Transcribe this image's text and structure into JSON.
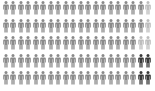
{
  "chart_data": {
    "type": "pictogram",
    "title": "",
    "total_units": 100,
    "columns": 20,
    "rows": 5,
    "icon": "person-icon",
    "categories": [
      "gray",
      "light",
      "dark"
    ],
    "values": [
      92,
      4,
      4
    ],
    "colors": {
      "gray": "#8a8a8a",
      "light": "#bdbdbd",
      "dark": "#3a3a3a"
    },
    "grid": [
      [
        "gray",
        "gray",
        "gray",
        "gray",
        "gray",
        "gray",
        "gray",
        "gray",
        "gray",
        "gray",
        "gray",
        "gray",
        "gray",
        "gray",
        "gray",
        "gray",
        "gray",
        "gray",
        "gray",
        "light"
      ],
      [
        "gray",
        "gray",
        "gray",
        "gray",
        "gray",
        "gray",
        "gray",
        "gray",
        "gray",
        "gray",
        "gray",
        "gray",
        "gray",
        "gray",
        "gray",
        "gray",
        "gray",
        "gray",
        "gray",
        "light"
      ],
      [
        "gray",
        "gray",
        "gray",
        "gray",
        "gray",
        "gray",
        "gray",
        "gray",
        "gray",
        "gray",
        "gray",
        "gray",
        "gray",
        "gray",
        "gray",
        "gray",
        "gray",
        "gray",
        "light",
        "light"
      ],
      [
        "gray",
        "gray",
        "gray",
        "gray",
        "gray",
        "gray",
        "gray",
        "gray",
        "gray",
        "gray",
        "gray",
        "gray",
        "gray",
        "gray",
        "gray",
        "gray",
        "gray",
        "gray",
        "dark",
        "dark"
      ],
      [
        "gray",
        "gray",
        "gray",
        "gray",
        "gray",
        "gray",
        "gray",
        "gray",
        "gray",
        "gray",
        "gray",
        "gray",
        "gray",
        "gray",
        "gray",
        "gray",
        "gray",
        "gray",
        "dark",
        "dark"
      ]
    ],
    "xlabel": "",
    "ylabel": "",
    "legend": []
  },
  "layout": {
    "row_tops": [
      1,
      18.5,
      36,
      53.5,
      71
    ]
  }
}
